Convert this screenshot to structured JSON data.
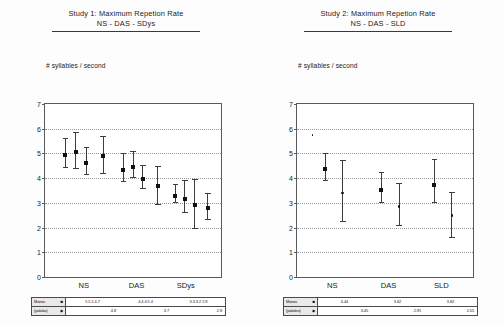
{
  "panels": [
    {
      "id": "study1",
      "title_line1": "Study 1: Maximum Repetion Rate",
      "title_line2": "NS - DAS - SDys",
      "axis_label": "# syllables / second",
      "legend": {
        "rows": [
          {
            "name": "Monos",
            "symbol": "■",
            "cells": [
              "5  5.1 4.7",
              "4.4 4.5  4",
              "3.3 3.2 2.9"
            ]
          },
          {
            "name": "(palaba)",
            "symbol": "◆",
            "cells": [
              "4.8",
              "3.7",
              "2.8"
            ]
          }
        ]
      }
    },
    {
      "id": "study2",
      "title_line1": "Study 2: Maximum Repetion Rate",
      "title_line2": "NS - DAS - SLD",
      "axis_label": "# syllables / second",
      "legend": {
        "rows": [
          {
            "name": "Monos",
            "symbol": "■",
            "cells": [
              "4.44",
              "3.62",
              "3.82"
            ]
          },
          {
            "name": "(palabra)",
            "symbol": "◆",
            "cells": [
              "3.45",
              "2.91",
              "2.55"
            ]
          }
        ]
      }
    }
  ],
  "chart_data": [
    {
      "id": "study1",
      "type": "scatter",
      "title": "Study 1: Maximum Repetion Rate  NS - DAS - SDys",
      "xlabel": "",
      "ylabel": "# syllables / second",
      "ylim": [
        0,
        7
      ],
      "yticks": [
        0,
        1,
        2,
        3,
        4,
        5,
        6,
        7
      ],
      "grid": true,
      "grid_axis": "y",
      "legend_position": "below-table",
      "categories": [
        "NS",
        "DAS",
        "SDys"
      ],
      "group_centers_pct": [
        22,
        52,
        80
      ],
      "points": [
        {
          "group": "NS",
          "x_pct": 11.5,
          "y": 5.02,
          "lo": 4.45,
          "hi": 5.62,
          "marker": "square"
        },
        {
          "group": "NS",
          "x_pct": 17.5,
          "y": 5.12,
          "lo": 4.42,
          "hi": 5.85,
          "marker": "square"
        },
        {
          "group": "NS",
          "x_pct": 23.5,
          "y": 4.7,
          "lo": 4.18,
          "hi": 5.25,
          "marker": "square"
        },
        {
          "group": "NS",
          "x_pct": 33.0,
          "y": 4.98,
          "lo": 4.2,
          "hi": 5.72,
          "marker": "square"
        },
        {
          "group": "DAS",
          "x_pct": 44.5,
          "y": 4.42,
          "lo": 3.9,
          "hi": 5.0,
          "marker": "square"
        },
        {
          "group": "DAS",
          "x_pct": 50.0,
          "y": 4.55,
          "lo": 4.05,
          "hi": 5.1,
          "marker": "square"
        },
        {
          "group": "DAS",
          "x_pct": 55.5,
          "y": 4.05,
          "lo": 3.62,
          "hi": 4.52,
          "marker": "square"
        },
        {
          "group": "DAS",
          "x_pct": 64.0,
          "y": 3.75,
          "lo": 2.95,
          "hi": 4.48,
          "marker": "square"
        },
        {
          "group": "SDys",
          "x_pct": 74.0,
          "y": 3.35,
          "lo": 3.02,
          "hi": 3.78,
          "marker": "square"
        },
        {
          "group": "SDys",
          "x_pct": 79.5,
          "y": 3.25,
          "lo": 2.62,
          "hi": 3.92,
          "marker": "square"
        },
        {
          "group": "SDys",
          "x_pct": 85.0,
          "y": 2.98,
          "lo": 1.98,
          "hi": 3.95,
          "marker": "square"
        },
        {
          "group": "SDys",
          "x_pct": 92.5,
          "y": 2.88,
          "lo": 2.35,
          "hi": 3.4,
          "marker": "square"
        }
      ],
      "stray_marks": []
    },
    {
      "id": "study2",
      "type": "scatter",
      "title": "Study 2: Maximum Repetion Rate  NS - DAS - SLD",
      "xlabel": "",
      "ylabel": "# syllables / second",
      "ylim": [
        0,
        7
      ],
      "yticks": [
        0,
        1,
        2,
        3,
        4,
        5,
        6,
        7
      ],
      "grid": true,
      "grid_axis": "y",
      "legend_position": "below-table",
      "categories": [
        "NS",
        "DAS",
        "SLD"
      ],
      "group_centers_pct": [
        20,
        52,
        82
      ],
      "points": [
        {
          "group": "NS",
          "x_pct": 16.0,
          "y": 4.44,
          "lo": 3.92,
          "hi": 5.0,
          "marker": "square",
          "series": "Monos"
        },
        {
          "group": "NS",
          "x_pct": 26.0,
          "y": 3.45,
          "lo": 2.25,
          "hi": 4.72,
          "marker": "dot",
          "series": "(palabra)"
        },
        {
          "group": "DAS",
          "x_pct": 48.0,
          "y": 3.62,
          "lo": 3.05,
          "hi": 4.25,
          "marker": "square",
          "series": "Monos"
        },
        {
          "group": "DAS",
          "x_pct": 58.0,
          "y": 2.91,
          "lo": 2.1,
          "hi": 3.8,
          "marker": "dot",
          "series": "(palabra)"
        },
        {
          "group": "SLD",
          "x_pct": 78.0,
          "y": 3.82,
          "lo": 3.05,
          "hi": 4.78,
          "marker": "square",
          "series": "Monos"
        },
        {
          "group": "SLD",
          "x_pct": 88.0,
          "y": 2.55,
          "lo": 1.62,
          "hi": 3.45,
          "marker": "dot",
          "series": "(palabra)"
        }
      ],
      "stray_marks": [
        {
          "x_pct": 9.0,
          "y": 5.78
        }
      ]
    }
  ]
}
